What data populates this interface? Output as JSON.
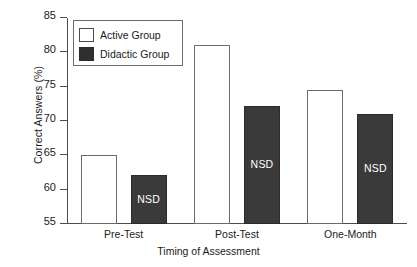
{
  "chart_data": {
    "type": "bar",
    "title": "",
    "xlabel": "Timing of Assessment",
    "ylabel": "Correct Answers (%)",
    "categories": [
      "Pre-Test",
      "Post-Test",
      "One-Month"
    ],
    "series": [
      {
        "name": "Active Group",
        "color": "#ffffff",
        "values": [
          65.1,
          81.0,
          74.5
        ],
        "annotations": [
          "",
          "",
          ""
        ]
      },
      {
        "name": "Didactic Group",
        "color": "#3a3a3a",
        "values": [
          62.1,
          72.2,
          71.0
        ],
        "annotations": [
          "NSD",
          "NSD",
          "NSD"
        ]
      }
    ],
    "ylim": [
      55,
      85
    ],
    "yticks": [
      55,
      60,
      65,
      70,
      75,
      80,
      85
    ],
    "ytick_labels": [
      "55",
      "60",
      "65",
      "70",
      "75",
      "80",
      "85"
    ],
    "grid": false,
    "legend_position": "upper-left"
  },
  "legend": {
    "items": [
      {
        "label": "Active Group",
        "swatch": "active-group"
      },
      {
        "label": "Didactic Group",
        "swatch": "didactic-group"
      }
    ]
  }
}
